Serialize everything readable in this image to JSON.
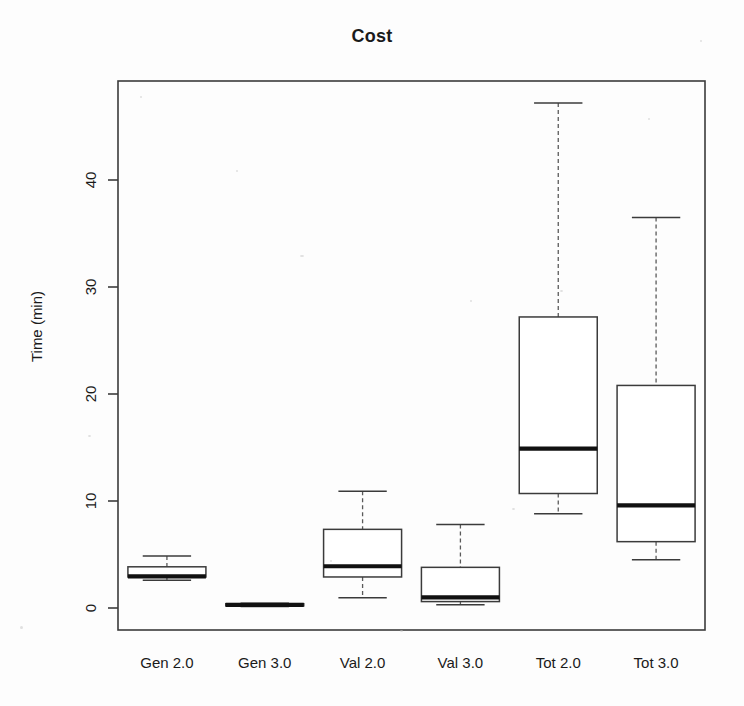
{
  "chart_data": {
    "type": "box",
    "title": "Cost",
    "xlabel": "",
    "ylabel": "Time (min)",
    "ylim": [
      -1.5,
      49
    ],
    "yticks": [
      0,
      10,
      20,
      30,
      40
    ],
    "ytick_labels": [
      "0",
      "10",
      "20",
      "30",
      "40"
    ],
    "grid": false,
    "legend": "none",
    "categories": [
      "Gen 2.0",
      "Gen 3.0",
      "Val 2.0",
      "Val 3.0",
      "Tot 2.0",
      "Tot 3.0"
    ],
    "boxes": [
      {
        "label": "Gen 2.0",
        "whisker_low": 2.6,
        "q1": 2.9,
        "median": 2.95,
        "q3": 3.85,
        "whisker_high": 4.85
      },
      {
        "label": "Gen 3.0",
        "whisker_low": 0.15,
        "q1": 0.2,
        "median": 0.3,
        "q3": 0.4,
        "whisker_high": 0.45
      },
      {
        "label": "Val 2.0",
        "whisker_low": 0.95,
        "q1": 2.9,
        "median": 3.9,
        "q3": 7.35,
        "whisker_high": 10.9
      },
      {
        "label": "Val 3.0",
        "whisker_low": 0.3,
        "q1": 0.6,
        "median": 1.0,
        "q3": 3.8,
        "whisker_high": 7.8
      },
      {
        "label": "Tot 2.0",
        "whisker_low": 8.8,
        "q1": 10.7,
        "median": 14.9,
        "q3": 27.2,
        "whisker_high": 47.2
      },
      {
        "label": "Tot 3.0",
        "whisker_low": 4.5,
        "q1": 6.2,
        "median": 9.6,
        "q3": 20.8,
        "whisker_high": 36.5
      }
    ],
    "colors": {
      "box_fill": "#ffffff",
      "box_stroke": "#3b3b3b",
      "median": "#111111",
      "whisker": "#5a5a5a",
      "background": "#fdfdfd",
      "text": "#1a1a1a"
    }
  }
}
